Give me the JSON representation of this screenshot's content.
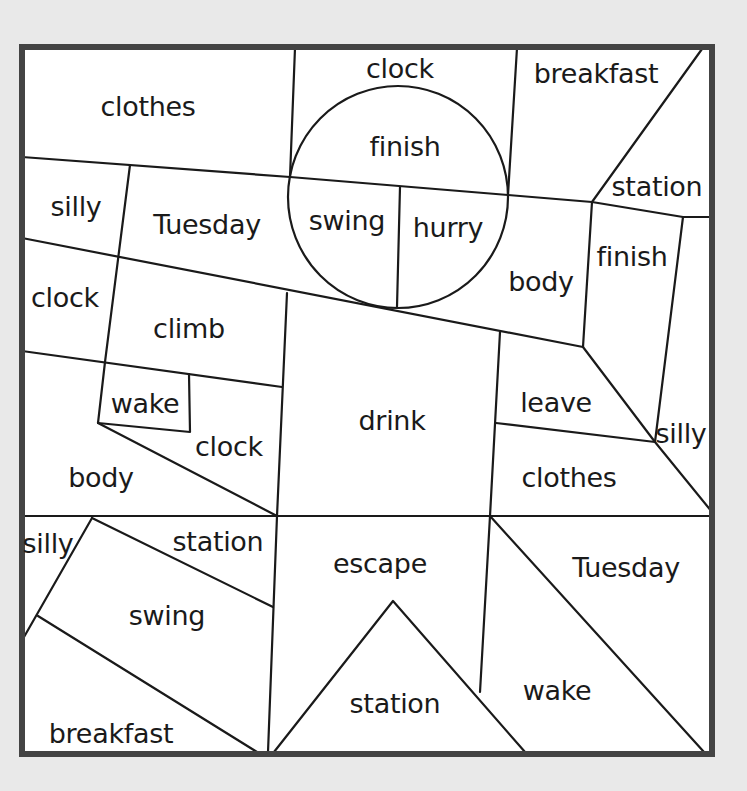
{
  "worksheet": {
    "colors": {
      "background": "#e9e9e9",
      "paper": "#ffffff",
      "frame": "#444444",
      "lines": "#1a1a1a",
      "text": "#1a1a1a"
    },
    "regions": [
      {
        "id": "r1",
        "word": "clothes",
        "x": 148,
        "y": 106
      },
      {
        "id": "r2",
        "word": "clock",
        "x": 400,
        "y": 68
      },
      {
        "id": "r3",
        "word": "breakfast",
        "x": 596,
        "y": 73
      },
      {
        "id": "r4",
        "word": "finish",
        "x": 405,
        "y": 146
      },
      {
        "id": "r5",
        "word": "station",
        "x": 657,
        "y": 186
      },
      {
        "id": "r6",
        "word": "silly",
        "x": 76,
        "y": 206
      },
      {
        "id": "r7",
        "word": "Tuesday",
        "x": 207,
        "y": 224
      },
      {
        "id": "r8",
        "word": "swing",
        "x": 347,
        "y": 220
      },
      {
        "id": "r9",
        "word": "hurry",
        "x": 448,
        "y": 227
      },
      {
        "id": "r10",
        "word": "body",
        "x": 541,
        "y": 281
      },
      {
        "id": "r11",
        "word": "finish",
        "x": 632,
        "y": 256
      },
      {
        "id": "r12",
        "word": "clock",
        "x": 65,
        "y": 297
      },
      {
        "id": "r13",
        "word": "climb",
        "x": 189,
        "y": 328
      },
      {
        "id": "r14",
        "word": "wake",
        "x": 145,
        "y": 403
      },
      {
        "id": "r15",
        "word": "drink",
        "x": 392,
        "y": 420
      },
      {
        "id": "r16",
        "word": "leave",
        "x": 556,
        "y": 402
      },
      {
        "id": "r17",
        "word": "silly",
        "x": 681,
        "y": 433
      },
      {
        "id": "r18",
        "word": "clock",
        "x": 229,
        "y": 446
      },
      {
        "id": "r19",
        "word": "body",
        "x": 101,
        "y": 477
      },
      {
        "id": "r20",
        "word": "clothes",
        "x": 569,
        "y": 477
      },
      {
        "id": "r21",
        "word": "silly",
        "x": 48,
        "y": 543
      },
      {
        "id": "r22",
        "word": "station",
        "x": 218,
        "y": 541
      },
      {
        "id": "r23",
        "word": "escape",
        "x": 380,
        "y": 563
      },
      {
        "id": "r24",
        "word": "Tuesday",
        "x": 626,
        "y": 567
      },
      {
        "id": "r25",
        "word": "swing",
        "x": 167,
        "y": 615
      },
      {
        "id": "r26",
        "word": "station",
        "x": 395,
        "y": 703
      },
      {
        "id": "r27",
        "word": "wake",
        "x": 557,
        "y": 690
      },
      {
        "id": "r28",
        "word": "breakfast",
        "x": 111,
        "y": 733
      }
    ]
  }
}
